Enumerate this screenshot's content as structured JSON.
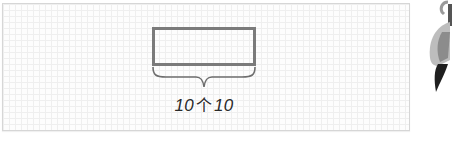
{
  "diagram": {
    "type": "bar-model",
    "rectangle": {
      "label": "",
      "stroke_color": "#7b7b7b"
    },
    "brace_label": {
      "left_number": "10",
      "measure_word": "个",
      "right_number": "10"
    },
    "grid_background": true
  },
  "decoration": {
    "icon": "paintbrush-icon"
  }
}
